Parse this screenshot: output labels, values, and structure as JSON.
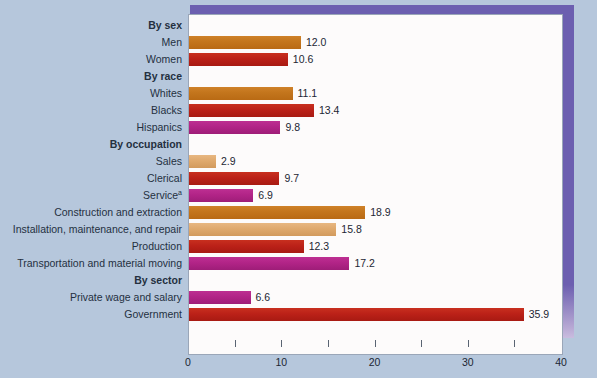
{
  "chart_data": {
    "type": "bar",
    "orientation": "horizontal",
    "title": "",
    "xlabel": "",
    "ylabel": "",
    "xlim": [
      0,
      40
    ],
    "xticks": [
      0,
      10,
      20,
      30,
      40
    ],
    "xtick_labels": [
      "0",
      "10",
      "20",
      "30",
      "40"
    ],
    "minor_xticks": [
      5,
      15,
      25,
      35
    ],
    "grid": false,
    "legend": "none",
    "groups": [
      {
        "heading": "By sex",
        "items": [
          {
            "label": "Men",
            "value": 12.0,
            "value_label": "12.0",
            "color": "#c4761d",
            "color_name": "orange"
          },
          {
            "label": "Women",
            "value": 10.6,
            "value_label": "10.6",
            "color": "#bb2118",
            "color_name": "red"
          }
        ]
      },
      {
        "heading": "By race",
        "items": [
          {
            "label": "Whites",
            "value": 11.1,
            "value_label": "11.1",
            "color": "#c4761d",
            "color_name": "orange"
          },
          {
            "label": "Blacks",
            "value": 13.4,
            "value_label": "13.4",
            "color": "#bb2118",
            "color_name": "red"
          },
          {
            "label": "Hispanics",
            "value": 9.8,
            "value_label": "9.8",
            "color": "#b22487",
            "color_name": "magenta"
          }
        ]
      },
      {
        "heading": "By occupation",
        "items": [
          {
            "label": "Sales",
            "value": 2.9,
            "value_label": "2.9",
            "color": "#dfa96d",
            "color_name": "tan"
          },
          {
            "label": "Clerical",
            "value": 9.7,
            "value_label": "9.7",
            "color": "#bb2118",
            "color_name": "red"
          },
          {
            "label": "Service",
            "superscript": "a",
            "value": 6.9,
            "value_label": "6.9",
            "color": "#b22487",
            "color_name": "magenta"
          },
          {
            "label": "Construction and extraction",
            "value": 18.9,
            "value_label": "18.9",
            "color": "#c4761d",
            "color_name": "orange"
          },
          {
            "label": "Installation, maintenance, and repair",
            "value": 15.8,
            "value_label": "15.8",
            "color": "#dfa96d",
            "color_name": "tan"
          },
          {
            "label": "Production",
            "value": 12.3,
            "value_label": "12.3",
            "color": "#bb2118",
            "color_name": "red"
          },
          {
            "label": "Transportation and material moving",
            "value": 17.2,
            "value_label": "17.2",
            "color": "#b22487",
            "color_name": "magenta"
          }
        ]
      },
      {
        "heading": "By sector",
        "items": [
          {
            "label": "Private wage and salary",
            "value": 6.6,
            "value_label": "6.6",
            "color": "#b22487",
            "color_name": "magenta"
          },
          {
            "label": "Government",
            "value": 35.9,
            "value_label": "35.9",
            "color": "#bb2118",
            "color_name": "red"
          }
        ]
      }
    ]
  },
  "style": {
    "background": "#b6c7dc",
    "panel": "#fdfbfb",
    "frame_accent": "#6c5fb0",
    "text": "#24303f"
  }
}
